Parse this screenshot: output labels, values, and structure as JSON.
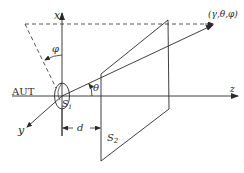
{
  "diagram": {
    "type": "antenna-measurement-geometry",
    "axes": {
      "x_label": "x",
      "y_label": "y",
      "z_label": "z"
    },
    "labels": {
      "aut": "AUT",
      "s1": "S",
      "s1_sub": "1",
      "s2": "S",
      "s2_sub": "2",
      "distance": "d",
      "theta": "θ",
      "phi": "φ",
      "point": "(γ,θ,φ)"
    },
    "colors": {
      "line": "#2a2a2a",
      "background": "#ffffff"
    }
  }
}
